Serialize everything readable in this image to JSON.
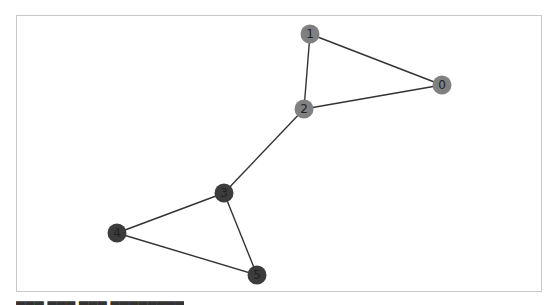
{
  "graph": {
    "nodes": [
      {
        "id": "0",
        "label": "0",
        "x": 442,
        "y": 85,
        "color": "#808080"
      },
      {
        "id": "1",
        "label": "1",
        "x": 310,
        "y": 34,
        "color": "#808080"
      },
      {
        "id": "2",
        "label": "2",
        "x": 304,
        "y": 109,
        "color": "#808080"
      },
      {
        "id": "3",
        "label": "3",
        "x": 224,
        "y": 193,
        "color": "#3c3c3c"
      },
      {
        "id": "4",
        "label": "4",
        "x": 117,
        "y": 233,
        "color": "#3c3c3c"
      },
      {
        "id": "5",
        "label": "5",
        "x": 257,
        "y": 275,
        "color": "#3c3c3c"
      }
    ],
    "edges": [
      [
        "0",
        "1"
      ],
      [
        "0",
        "2"
      ],
      [
        "1",
        "2"
      ],
      [
        "2",
        "3"
      ],
      [
        "3",
        "4"
      ],
      [
        "3",
        "5"
      ],
      [
        "4",
        "5"
      ]
    ],
    "node_radius": 9.5,
    "edge_color": "#333333"
  },
  "caption": {
    "text": "▆▆▆  ▆▆▆  ▆▆▆  ▆▆▆▆▆▆▆▆"
  }
}
